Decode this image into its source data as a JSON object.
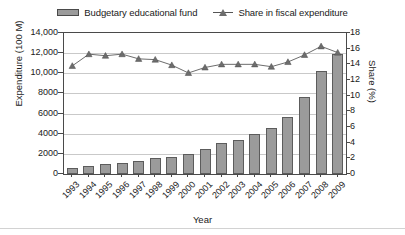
{
  "chart_data": {
    "type": "bar",
    "title": "",
    "xlabel": "Year",
    "ylabel": "Expenditure (100 M)",
    "y2label": "Share (%)",
    "categories": [
      "1993",
      "1994",
      "1995",
      "1996",
      "1997",
      "1998",
      "1999",
      "2000",
      "2001",
      "2002",
      "2003",
      "2004",
      "2005",
      "2006",
      "2007",
      "2008",
      "2009"
    ],
    "ylim": [
      0,
      14000
    ],
    "y2lim": [
      0,
      18
    ],
    "yticks": [
      "0",
      "2000",
      "4000",
      "6000",
      "8000",
      "10,000",
      "12,000",
      "14,000"
    ],
    "ytick_values": [
      0,
      2000,
      4000,
      6000,
      8000,
      10000,
      12000,
      14000
    ],
    "y2ticks": [
      "0",
      "2",
      "4",
      "6",
      "8",
      "10",
      "12",
      "14",
      "16",
      "18"
    ],
    "y2tick_values": [
      0,
      2,
      4,
      6,
      8,
      10,
      12,
      14,
      16,
      18
    ],
    "grid": true,
    "legend_position": "top",
    "series": [
      {
        "name": "Budgetary educational fund",
        "type": "bar",
        "axis": "left",
        "color": "#9b9b9b",
        "edge_color": "#5c5c5c",
        "values": [
          600,
          830,
          980,
          1090,
          1280,
          1560,
          1680,
          2010,
          2470,
          3110,
          3420,
          3990,
          4540,
          5700,
          7650,
          10230,
          11900
        ]
      },
      {
        "name": "Share in fiscal expenditure",
        "type": "line",
        "axis": "right",
        "color": "#6d6d6d",
        "marker": "triangle",
        "values": [
          13.8,
          15.3,
          15.1,
          15.3,
          14.7,
          14.6,
          13.9,
          12.9,
          13.6,
          14.0,
          14.0,
          14.0,
          13.7,
          14.3,
          15.2,
          16.3,
          15.5
        ]
      }
    ]
  },
  "legend": {
    "bar_label": "Budgetary educational fund",
    "line_label": "Share in fiscal expenditure"
  }
}
